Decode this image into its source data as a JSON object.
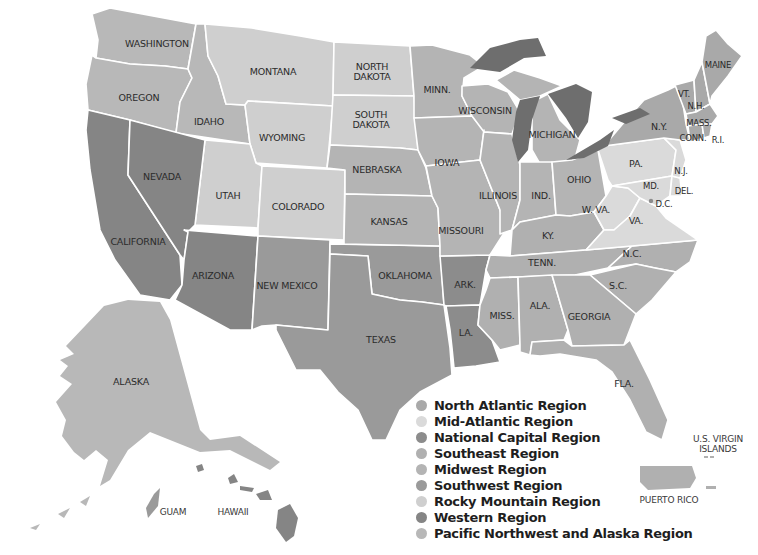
{
  "title_fragment": "…Field Stations",
  "colors": {
    "north_atlantic": "#a9a9a9",
    "mid_atlantic": "#dadada",
    "national_capital": "#8c8c8c",
    "southeast": "#b0b0b0",
    "midwest": "#b4b4b4",
    "southwest": "#9a9a9a",
    "rocky_mountain": "#cfcfcf",
    "western": "#858585",
    "pacific_northwest_alaska": "#b8b8b8",
    "lakes": "#6e6e6e",
    "border": "#ffffff"
  },
  "legend": {
    "items": [
      {
        "label": "North Atlantic Region",
        "color": "#a9a9a9"
      },
      {
        "label": "Mid-Atlantic Region",
        "color": "#dadada"
      },
      {
        "label": "National Capital Region",
        "color": "#8c8c8c"
      },
      {
        "label": "Southeast Region",
        "color": "#b0b0b0"
      },
      {
        "label": "Midwest Region",
        "color": "#b4b4b4"
      },
      {
        "label": "Southwest Region",
        "color": "#9a9a9a"
      },
      {
        "label": "Rocky Mountain Region",
        "color": "#cfcfcf"
      },
      {
        "label": "Western Region",
        "color": "#858585"
      },
      {
        "label": "Pacific Northwest and Alaska Region",
        "color": "#b8b8b8"
      }
    ]
  },
  "states": {
    "washington": "WASHINGTON",
    "oregon": "OREGON",
    "idaho": "IDAHO",
    "montana": "MONTANA",
    "wyoming": "WYOMING",
    "north_dakota_1": "NORTH",
    "north_dakota_2": "DAKOTA",
    "south_dakota_1": "SOUTH",
    "south_dakota_2": "DAKOTA",
    "nevada": "NEVADA",
    "california": "CALIFORNIA",
    "utah": "UTAH",
    "colorado": "COLORADO",
    "arizona": "ARIZONA",
    "new_mexico": "NEW MEXICO",
    "nebraska": "NEBRASKA",
    "kansas": "KANSAS",
    "oklahoma": "OKLAHOMA",
    "texas": "TEXAS",
    "minnesota": "MINN.",
    "iowa": "IOWA",
    "missouri": "MISSOURI",
    "arkansas": "ARK.",
    "louisiana": "LA.",
    "wisconsin": "WISCONSIN",
    "illinois": "ILLINOIS",
    "michigan": "MICHIGAN",
    "indiana": "IND.",
    "ohio": "OHIO",
    "kentucky": "KY.",
    "tennessee": "TENN.",
    "mississippi": "MISS.",
    "alabama": "ALA.",
    "georgia": "GEORGIA",
    "florida": "FLA.",
    "south_carolina": "S.C.",
    "north_carolina": "N.C.",
    "virginia": "VA.",
    "west_virginia": "W. VA.",
    "pennsylvania": "PA.",
    "new_york": "N.Y.",
    "vermont": "VT.",
    "new_hampshire": "N.H.",
    "maine": "MAINE",
    "massachusetts": "MASS.",
    "connecticut": "CONN.",
    "rhode_island": "R.I.",
    "new_jersey": "N.J.",
    "delaware": "DEL.",
    "maryland": "MD.",
    "dc": "D.C.",
    "alaska": "ALASKA"
  },
  "territories": {
    "guam": "GUAM",
    "hawaii": "HAWAII",
    "puerto_rico": "PUERTO RICO",
    "virgin_islands_1": "U.S. VIRGIN",
    "virgin_islands_2": "ISLANDS"
  }
}
